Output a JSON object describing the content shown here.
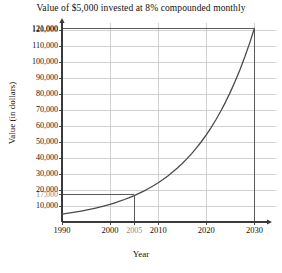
{
  "chart_data": {
    "type": "line",
    "title": "Value of $5,000 invested at 8% compounded monthly",
    "xlabel": "Year",
    "ylabel": "Value (in dollars)",
    "xlim": [
      1990,
      2032
    ],
    "ylim": [
      0,
      124000
    ],
    "grid": true,
    "legend": "none",
    "x_ticks": [
      {
        "value": 1990,
        "label": "1990",
        "highlight": false
      },
      {
        "value": 2000,
        "label": "2000",
        "highlight": false
      },
      {
        "value": 2005,
        "label": "2005",
        "highlight": true
      },
      {
        "value": 2010,
        "label": "2010",
        "highlight": false
      },
      {
        "value": 2020,
        "label": "2020",
        "highlight": false
      },
      {
        "value": 2030,
        "label": "2030",
        "highlight": false
      }
    ],
    "y_ticks": [
      {
        "value": 10000,
        "label": "10,000",
        "highlight": false
      },
      {
        "value": 17000,
        "label": "17,000",
        "highlight": true
      },
      {
        "value": 20000,
        "label": "20,000",
        "highlight": false
      },
      {
        "value": 30000,
        "label": "30,000",
        "highlight": false
      },
      {
        "value": 40000,
        "label": "40,000",
        "highlight": false
      },
      {
        "value": 50000,
        "label": "50,000",
        "highlight": false
      },
      {
        "value": 60000,
        "label": "60,000",
        "highlight": false
      },
      {
        "value": 70000,
        "label": "70,000",
        "highlight": false
      },
      {
        "value": 80000,
        "label": "80,000",
        "highlight": false
      },
      {
        "value": 90000,
        "label": "90,000",
        "highlight": false
      },
      {
        "value": 100000,
        "label": "100,000",
        "highlight": false
      },
      {
        "value": 110000,
        "label": "110,000",
        "highlight": false
      },
      {
        "value": 120000,
        "label": "120,000",
        "highlight": false
      },
      {
        "value": 121000,
        "label": "121,000",
        "highlight": false
      }
    ],
    "gridlines_y": [
      10000,
      20000,
      30000,
      40000,
      50000,
      60000,
      70000,
      80000,
      90000,
      100000,
      110000,
      120000
    ],
    "gridlines_x": [
      2000,
      2010,
      2020,
      2030
    ],
    "series": [
      {
        "name": "Account value",
        "formula": "5000 * (1 + 0.08/12)^(12*(year-1990))",
        "x": [
          1990,
          1991,
          1992,
          1993,
          1994,
          1995,
          1996,
          1997,
          1998,
          1999,
          2000,
          2001,
          2002,
          2003,
          2004,
          2005,
          2006,
          2007,
          2008,
          2009,
          2010,
          2011,
          2012,
          2013,
          2014,
          2015,
          2016,
          2017,
          2018,
          2019,
          2020,
          2021,
          2022,
          2023,
          2024,
          2025,
          2026,
          2027,
          2028,
          2029,
          2030
        ],
        "y": [
          5000,
          5415,
          5864,
          6350,
          6876,
          7446,
          8064,
          8733,
          9457,
          10241,
          11090,
          12010,
          13007,
          14086,
          15254,
          16519,
          17889,
          19373,
          20980,
          22720,
          24605,
          26646,
          28857,
          31251,
          33844,
          36651,
          39692,
          42985,
          46551,
          50413,
          54597,
          59126,
          64033,
          69347,
          75102,
          81335,
          88085,
          95393,
          103307,
          111878,
          121159
        ]
      }
    ],
    "reference_lines": [
      {
        "name": "value-2005",
        "x": 2005,
        "y": 17000,
        "x_label": "2005",
        "y_label": "17,000"
      },
      {
        "name": "value-2030",
        "x": 2030,
        "y": 121000,
        "x_label": "2030",
        "y_label": "121,000"
      }
    ]
  }
}
